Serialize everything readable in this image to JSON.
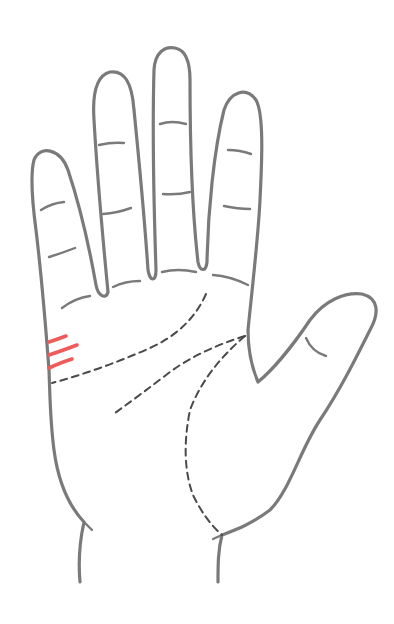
{
  "figure": {
    "description": "Line drawing of an open right palm with dashed palm lines and three highlighted short lines below the pinky (marriage lines)",
    "colors": {
      "outline": "#7a7a7a",
      "palm_lines": "#4a4a4a",
      "highlight": "#f05a5a",
      "background": "#ffffff"
    },
    "highlighted_lines_count": 3,
    "dashed_lines": [
      "heart-line",
      "head-line",
      "fate-line",
      "life-line"
    ]
  }
}
